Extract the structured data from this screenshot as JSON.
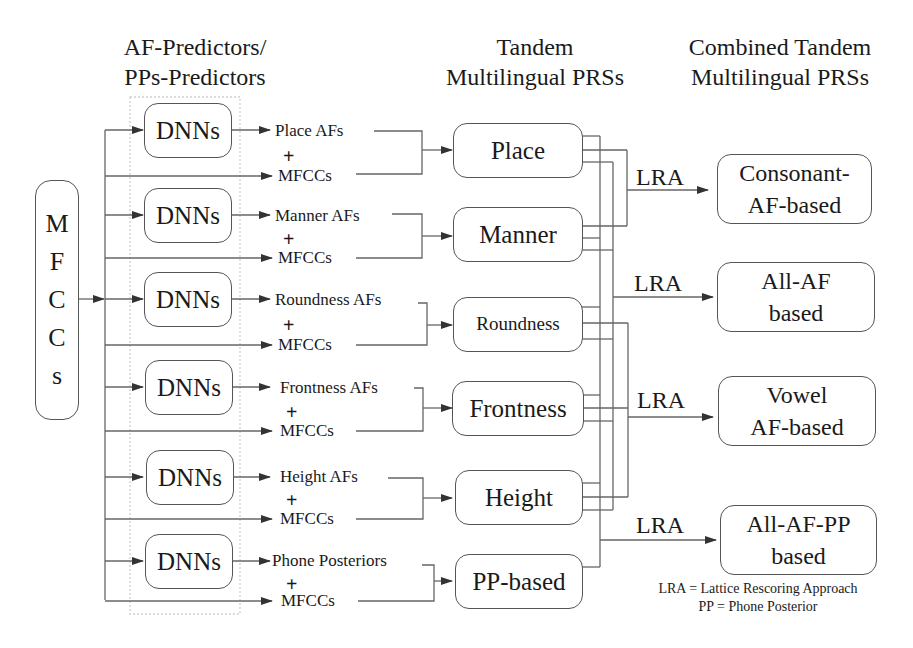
{
  "headers": {
    "predictors": [
      "AF-Predictors/",
      "PPs-Predictors"
    ],
    "tandem": [
      "Tandem",
      "Multilingual PRSs"
    ],
    "combined": [
      "Combined Tandem",
      "Multilingual PRSs"
    ]
  },
  "input": {
    "letters": [
      "M",
      "F",
      "C",
      "C",
      "s"
    ]
  },
  "rows": [
    {
      "dnn": "DNNs",
      "feature": "Place AFs",
      "plus": "+",
      "mfcc": "MFCCs",
      "prs": "Place"
    },
    {
      "dnn": "DNNs",
      "feature": "Manner AFs",
      "plus": "+",
      "mfcc": "MFCCs",
      "prs": "Manner"
    },
    {
      "dnn": "DNNs",
      "feature": "Roundness AFs",
      "plus": "+",
      "mfcc": "MFCCs",
      "prs": "Roundness"
    },
    {
      "dnn": "DNNs",
      "feature": "Frontness AFs",
      "plus": "+",
      "mfcc": "MFCCs",
      "prs": "Frontness"
    },
    {
      "dnn": "DNNs",
      "feature": "Height AFs",
      "plus": "+",
      "mfcc": "MFCCs",
      "prs": "Height"
    },
    {
      "dnn": "DNNs",
      "feature": "Phone Posteriors",
      "plus": "+",
      "mfcc": "MFCCs",
      "prs": "PP-based"
    }
  ],
  "combined": [
    {
      "lra": "LRA",
      "line1": "Consonant-",
      "line2": "AF-based"
    },
    {
      "lra": "LRA",
      "line1": "All-AF",
      "line2": "based"
    },
    {
      "lra": "LRA",
      "line1": "Vowel",
      "line2": "AF-based"
    },
    {
      "lra": "LRA",
      "line1": "All-AF-PP",
      "line2": "based"
    }
  ],
  "legend": {
    "line1": "LRA = Lattice Rescoring Approach",
    "line2": "PP = Phone Posterior"
  },
  "colors": {
    "line": "#555555",
    "text": "#1a1a1a",
    "dotted_group": "#c8c8c8"
  }
}
